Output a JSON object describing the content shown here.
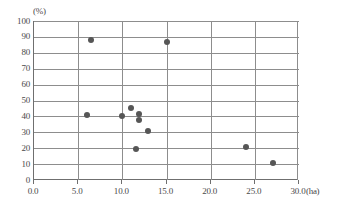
{
  "chart_data": {
    "type": "scatter",
    "title": "",
    "xlabel": "(ha)",
    "ylabel": "(%)",
    "xlim": [
      0,
      30
    ],
    "ylim": [
      0,
      100
    ],
    "xticks": [
      "0.0",
      "5.0",
      "10.0",
      "15.0",
      "20.0",
      "25.0",
      "30.0"
    ],
    "xtick_values": [
      0,
      5,
      10,
      15,
      20,
      25,
      30
    ],
    "yticks": [
      "0",
      "10",
      "20",
      "30",
      "40",
      "50",
      "60",
      "70",
      "80",
      "90",
      "100"
    ],
    "ytick_values": [
      0,
      10,
      20,
      30,
      40,
      50,
      60,
      70,
      80,
      90,
      100
    ],
    "grid": "both",
    "legend": "none",
    "marker_color": "#565656",
    "axis_color": "#6f6f6f",
    "grid_color": "#8d8d8d",
    "points": [
      {
        "x": 6.4,
        "y": 88.0
      },
      {
        "x": 15.0,
        "y": 87.0
      },
      {
        "x": 6.0,
        "y": 41.0
      },
      {
        "x": 10.0,
        "y": 40.0
      },
      {
        "x": 11.0,
        "y": 45.5
      },
      {
        "x": 11.9,
        "y": 41.5
      },
      {
        "x": 11.9,
        "y": 37.5
      },
      {
        "x": 12.9,
        "y": 31.0
      },
      {
        "x": 11.5,
        "y": 19.5
      },
      {
        "x": 24.0,
        "y": 21.0
      },
      {
        "x": 27.0,
        "y": 11.0
      }
    ]
  },
  "axes": {
    "y_unit": "(%)",
    "x_unit": "(ha)"
  }
}
